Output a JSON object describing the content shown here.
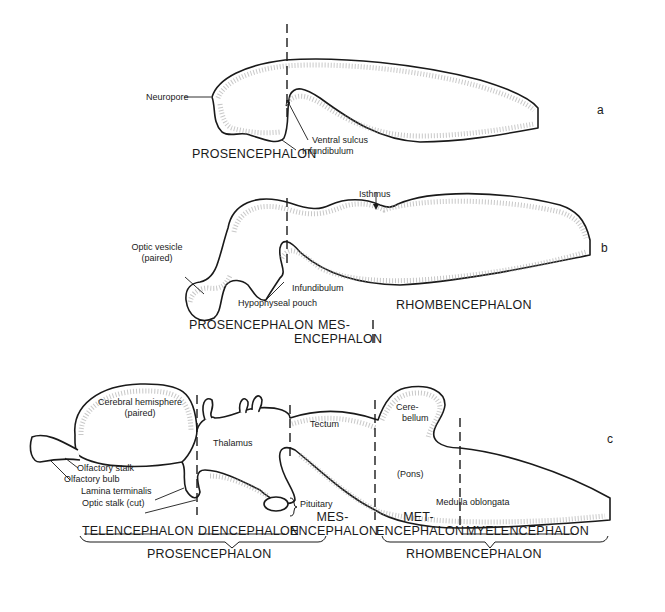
{
  "figure": {
    "panels": [
      {
        "id": "a",
        "letter": "a",
        "labels": {
          "neuropore": "Neuropore",
          "ventral_sulcus": "Ventral sulcus",
          "infundibulum": "Infundibulum"
        },
        "regions": {
          "prosencephalon": "PROSENCEPHALON"
        }
      },
      {
        "id": "b",
        "letter": "b",
        "labels": {
          "isthmus": "Isthmus",
          "optic_vesicle_1": "Optic vesicle",
          "optic_vesicle_2": "(paired)",
          "infundibulum": "Infundibulum",
          "hypophyseal_pouch": "Hypophyseal pouch"
        },
        "regions": {
          "prosencephalon": "PROSENCEPHALON",
          "mes_1": "MES-",
          "mes_2": "ENCEPHALON",
          "rhombencephalon": "RHOMBENCEPHALON"
        }
      },
      {
        "id": "c",
        "letter": "c",
        "labels": {
          "cerebral_hemisphere_1": "Cerebral hemisphere",
          "cerebral_hemisphere_2": "(paired)",
          "thalamus": "Thalamus",
          "tectum": "Tectum",
          "cerebellum_1": "Cere-",
          "cerebellum_2": "bellum",
          "pons": "(Pons)",
          "medulla_oblongata": "Medulla oblongata",
          "olfactory_stalk": "Olfactory stalk",
          "olfactory_bulb": "Olfactory bulb",
          "lamina_terminalis": "Lamina terminalis",
          "optic_stalk": "Optic stalk (cut)",
          "pituitary": "Pituitary"
        },
        "regions": {
          "telencephalon": "TELENCEPHALON",
          "diencephalon": "DIENCEPHALON",
          "mes_1": "MES-",
          "mes_2": "ENCEPHALON",
          "met_1": "MET-",
          "met_2": "ENCEPHALON",
          "myelencephalon": "MYELENCEPHALON",
          "prosencephalon": "PROSENCEPHALON",
          "rhombencephalon": "RHOMBENCEPHALON"
        }
      }
    ]
  }
}
